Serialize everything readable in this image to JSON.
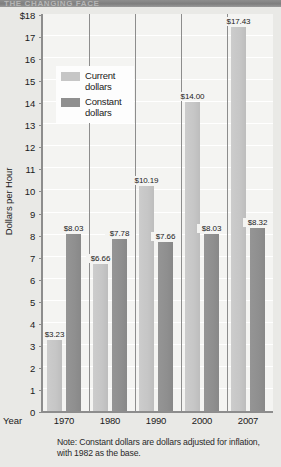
{
  "title_strip": {
    "text": "THE CHANGING FACE"
  },
  "chart_data": {
    "type": "bar",
    "title": "",
    "xlabel": "Year",
    "ylabel": "Dollars per Hour",
    "categories": [
      "1970",
      "1980",
      "1990",
      "2000",
      "2007"
    ],
    "series": [
      {
        "name": "Current dollars",
        "color": "#c6c6c6",
        "values": [
          3.23,
          6.66,
          10.19,
          14.0,
          17.43
        ],
        "labels": [
          "$3.23",
          "$6.66",
          "$10.19",
          "$14.00",
          "$17.43"
        ]
      },
      {
        "name": "Constant dollars",
        "color": "#8f8f8f",
        "values": [
          8.03,
          7.78,
          7.66,
          8.03,
          8.32
        ],
        "labels": [
          "$8.03",
          "$7.78",
          "$7.66",
          "$8.03",
          "$8.32"
        ]
      }
    ],
    "ylim": [
      0,
      18
    ],
    "ytick_labels": [
      "$18",
      "17",
      "16",
      "15",
      "14",
      "13",
      "12",
      "11",
      "10",
      "9",
      "8",
      "7",
      "6",
      "5",
      "4",
      "3",
      "2",
      "1",
      "0"
    ],
    "ytick_values": [
      18,
      17,
      16,
      15,
      14,
      13,
      12,
      11,
      10,
      9,
      8,
      7,
      6,
      5,
      4,
      3,
      2,
      1,
      0
    ],
    "grid": true,
    "legend_position": "upper-left"
  },
  "legend": {
    "items": [
      {
        "label_line1": "Current",
        "label_line2": "dollars",
        "swatch": "current"
      },
      {
        "label_line1": "Constant",
        "label_line2": "dollars",
        "swatch": "constant"
      }
    ]
  },
  "note": {
    "line1": "Note:  Constant dollars are dollars adjusted for inflation,",
    "line2": "with 1982 as the base."
  },
  "colors": {
    "current_bar": "#c6c6c6",
    "constant_bar": "#8f8f8f",
    "plot_background": "#f4f4f2",
    "page_background": "#e9e9e6",
    "axis": "#8d8d8d",
    "gridline": "#ffffff"
  }
}
